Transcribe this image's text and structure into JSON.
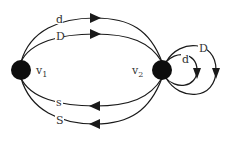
{
  "diagram": {
    "type": "directed multigraph",
    "nodes": [
      {
        "id": "v1",
        "label": "v",
        "subscript": "1"
      },
      {
        "id": "v2",
        "label": "v",
        "subscript": "2"
      }
    ],
    "edges": [
      {
        "from": "v1",
        "to": "v2",
        "label": "d"
      },
      {
        "from": "v1",
        "to": "v2",
        "label": "D"
      },
      {
        "from": "v2",
        "to": "v1",
        "label": "s"
      },
      {
        "from": "v2",
        "to": "v1",
        "label": "S"
      },
      {
        "from": "v2",
        "to": "v2",
        "label": "d"
      },
      {
        "from": "v2",
        "to": "v2",
        "label": "D"
      }
    ],
    "colors": {
      "node": "#0d0d0d",
      "edge": "#1a1a1a",
      "text": "#333333",
      "background": "#ffffff"
    }
  }
}
